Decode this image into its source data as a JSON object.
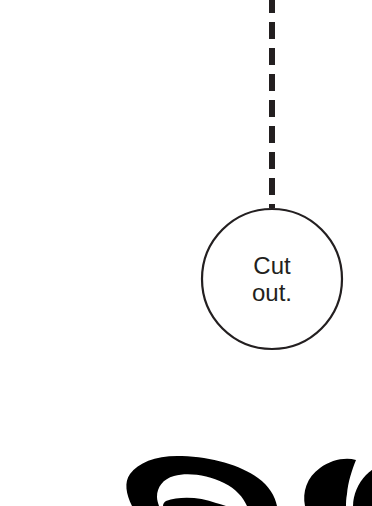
{
  "canvas": {
    "width": 372,
    "height": 506,
    "background_color": "#ffffff"
  },
  "diagram": {
    "stroke_color": "#231f20",
    "text_color": "#231f20",
    "connector": {
      "name": "dashed-connector",
      "style": "dashed",
      "orientation": "vertical",
      "color": "#231f20",
      "stroke_width": 6,
      "dash_length": 17,
      "gap_length": 9,
      "x": 272,
      "y_start": 0,
      "y_end": 207,
      "cropped_at_top": true
    },
    "node": {
      "name": "cut-out-node",
      "shape": "circle",
      "center_x": 272,
      "center_y": 279,
      "radius": 70,
      "fill_color": "#ffffff",
      "stroke_color": "#231f20",
      "stroke_width": 2,
      "label_lines": [
        "Cut",
        "out."
      ],
      "label_font_size": 24
    },
    "bottom_artwork": {
      "name": "cropped-black-lettering",
      "description": "Heavy black cropped lettering at bottom edge",
      "color": "#000000",
      "y_start": 458,
      "cropped_at_bottom": true
    }
  }
}
